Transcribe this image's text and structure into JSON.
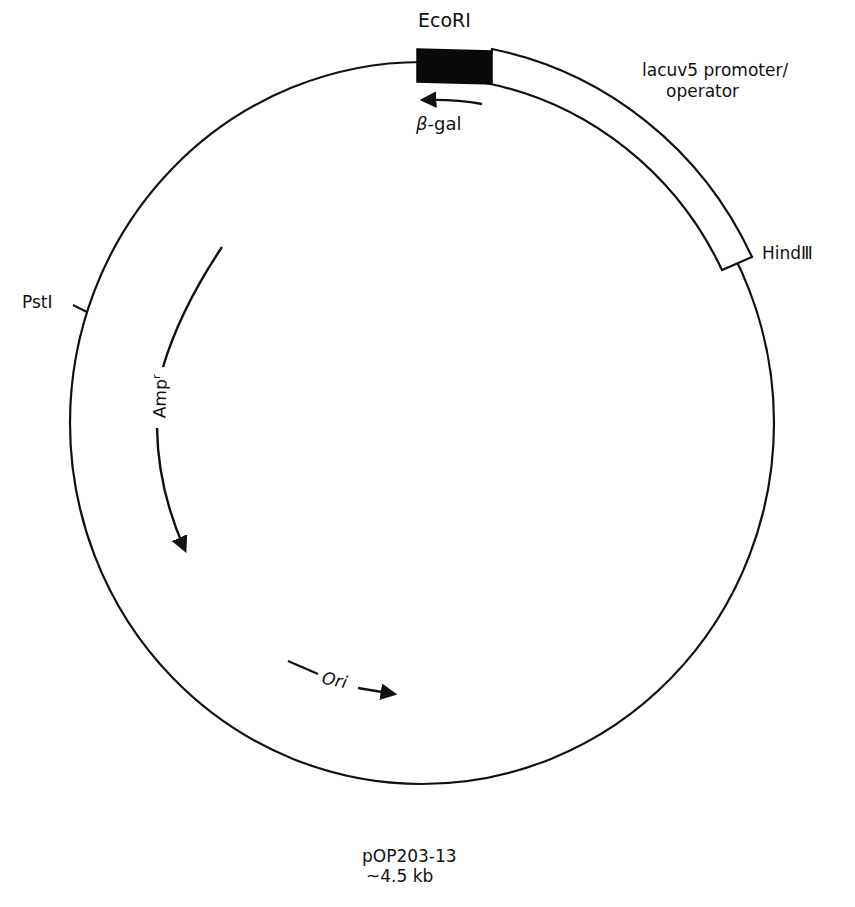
{
  "plasmid": {
    "name": "pOP203-13",
    "size": "~4.5 kb"
  },
  "sites": {
    "ecori": "EcoRI",
    "hindiii": "HindⅢ",
    "psti": "PstⅠ"
  },
  "features": {
    "promoter_line1": "lacuv5 promoter/",
    "promoter_line2": "operator",
    "beta_gal_symbol": "β",
    "beta_gal_text": "-gal",
    "ampr_main": "Amp",
    "ampr_sup": "r",
    "ori": "Ori"
  },
  "colors": {
    "line": "#111111",
    "lacz_block": "#0a0a0a",
    "background": "#ffffff"
  }
}
